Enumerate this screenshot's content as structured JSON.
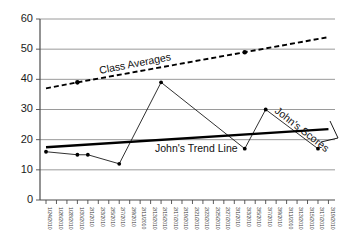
{
  "chart_data": {
    "type": "line",
    "title": "",
    "subtitle": "",
    "xlabel": "",
    "ylabel": "",
    "ylim": [
      0,
      60
    ],
    "yticks": [
      0,
      10,
      20,
      30,
      40,
      50,
      60
    ],
    "grid": true,
    "legend_position": "inline-annotations",
    "categories": [
      "1/24/2010",
      "1/26/2010",
      "1/28/2010",
      "1/30/2010",
      "2/1/2010",
      "2/3/2010",
      "2/5/2010",
      "2/7/2010",
      "2/9/2010",
      "2/11/2010",
      "2/13/2010",
      "2/15/2010",
      "2/17/2010",
      "2/19/2010",
      "2/21/2010",
      "2/23/2010",
      "2/25/2010",
      "2/27/2010",
      "3/1/2010",
      "3/3/2010",
      "3/5/2010",
      "3/7/2010",
      "3/9/2010",
      "3/11/2010",
      "3/13/2010",
      "3/15/2010",
      "3/17/2010",
      "3/19/2010"
    ],
    "series": [
      {
        "name": "John's Scores",
        "style": "solid-thin-markers",
        "points": [
          {
            "x": "1/24/2010",
            "y": 16
          },
          {
            "x": "1/30/2010",
            "y": 15
          },
          {
            "x": "2/1/2010",
            "y": 15
          },
          {
            "x": "2/7/2010",
            "y": 12
          },
          {
            "x": "2/15/2010",
            "y": 39
          },
          {
            "x": "3/3/2010",
            "y": 17
          },
          {
            "x": "3/7/2010",
            "y": 30
          },
          {
            "x": "3/17/2010",
            "y": 17
          }
        ]
      },
      {
        "name": "Class Averages",
        "style": "dashed-thick",
        "points": [
          {
            "x": "1/24/2010",
            "y": 37
          },
          {
            "x": "1/30/2010",
            "y": 39
          },
          {
            "x": "3/3/2010",
            "y": 49
          },
          {
            "x": "3/19/2010",
            "y": 54
          }
        ]
      },
      {
        "name": "John's Trend Line",
        "style": "solid-thick",
        "points": [
          {
            "x": "1/24/2010",
            "y": 17.5
          },
          {
            "x": "3/19/2010",
            "y": 23.5
          }
        ]
      }
    ],
    "annotations": [
      {
        "name": "Class Averages",
        "rotated": true
      },
      {
        "name": "John's Trend Line",
        "rotated": false
      },
      {
        "name": "John's Scores",
        "rotated": true
      }
    ]
  },
  "axis": {
    "y_tick_labels": [
      "60",
      "50",
      "40",
      "30",
      "20",
      "10",
      "0"
    ],
    "x_tick_labels": [
      "1/24/2010",
      "1/26/2010",
      "1/28/2010",
      "1/30/2010",
      "2/1/2010",
      "2/3/2010",
      "2/5/2010",
      "2/7/2010",
      "2/9/2010",
      "2/11/2010",
      "2/13/2010",
      "2/15/2010",
      "2/17/2010",
      "2/19/2010",
      "2/21/2010",
      "2/23/2010",
      "2/25/2010",
      "2/27/2010",
      "3/1/2010",
      "3/3/2010",
      "3/5/2010",
      "3/7/2010",
      "3/9/2010",
      "3/11/2010",
      "3/13/2010",
      "3/15/2010",
      "3/17/2010",
      "3/19/2010"
    ]
  },
  "labels": {
    "class_averages": "Class Averages",
    "johns_trend_line": "John's Trend Line",
    "johns_scores": "John's Scores"
  },
  "colors": {
    "series_scores": "#1a1a1a",
    "series_trend": "#000000",
    "series_average": "#000000",
    "gridline": "#9a9a9a",
    "axis": "#4a4a4a",
    "background": "#ffffff"
  }
}
